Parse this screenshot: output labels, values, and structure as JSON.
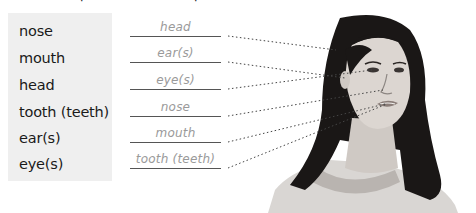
{
  "exercise": {
    "words": [
      "nose",
      "mouth",
      "head",
      "tooth (teeth)",
      "ear(s)",
      "eye(s)"
    ],
    "answers": [
      "head",
      "ear(s)",
      "eye(s)",
      "nose",
      "mouth",
      "tooth (teeth)"
    ]
  },
  "illustration": {
    "subject": "woman-portrait",
    "pointer_style": "dotted"
  },
  "colors": {
    "panel_bg": "#efefef",
    "answer_text": "#9a9a9a",
    "line": "#555555"
  }
}
